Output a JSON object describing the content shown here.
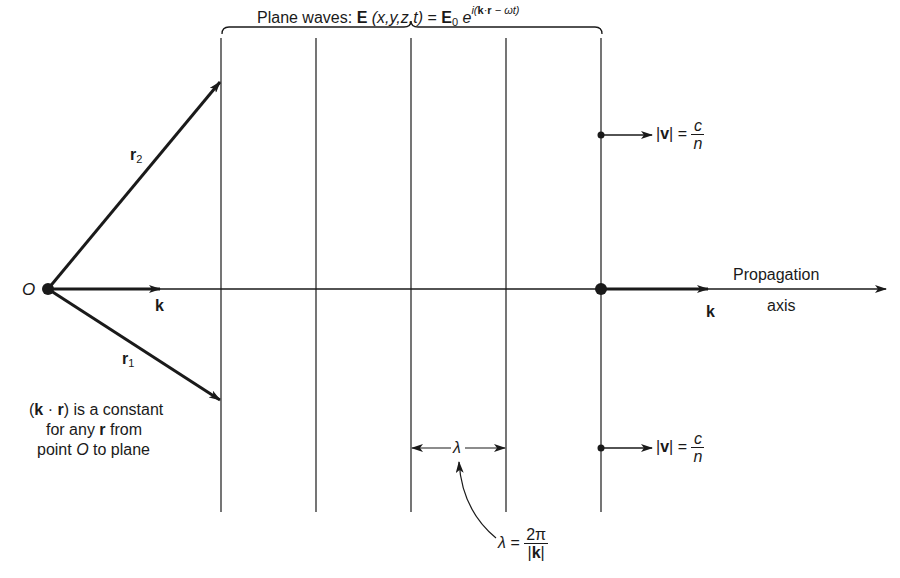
{
  "title": {
    "prefix": "Plane waves:",
    "E": "E",
    "args": "(x,y,z,t)",
    "eq": "=",
    "E0_base": "E",
    "E0_sub": "0",
    "e": "e",
    "exponent_i": "i(",
    "exponent_k": "k",
    "exponent_dot": "·",
    "exponent_r": "r",
    "exponent_rest": " − ωt)"
  },
  "origin": {
    "label": "O"
  },
  "vectors": {
    "k_left": "k",
    "k_right": "k",
    "r1": {
      "base": "r",
      "sub": "1"
    },
    "r2": {
      "base": "r",
      "sub": "2"
    }
  },
  "propagation": {
    "line1": "Propagation",
    "line2": "axis"
  },
  "velocity": {
    "lhs_open": "|",
    "lhs_v": "v",
    "lhs_close": "|",
    "eq": "=",
    "num": "c",
    "den": "n"
  },
  "wavelength": {
    "symbol": "λ",
    "formula_lhs": "λ =",
    "formula_num": "2π",
    "formula_den_open": "|",
    "formula_den_k": "k",
    "formula_den_close": "|"
  },
  "note": {
    "line1_open": "(",
    "line1_k": "k",
    "line1_dot": " · ",
    "line1_r": "r",
    "line1_rest": ") is a constant",
    "line2_pre": "for any ",
    "line2_r": "r",
    "line2_post": " from",
    "line3_pre": "point ",
    "line3_O": "O",
    "line3_post": " to plane"
  },
  "geometry": {
    "wavefront_x": [
      221,
      316,
      411,
      506,
      601
    ],
    "wavefront_y_top": 38,
    "wavefront_y_bottom": 512,
    "axis_y": 289,
    "origin_x": 48
  },
  "colors": {
    "ink": "#1a1a1a",
    "background": "#ffffff"
  }
}
